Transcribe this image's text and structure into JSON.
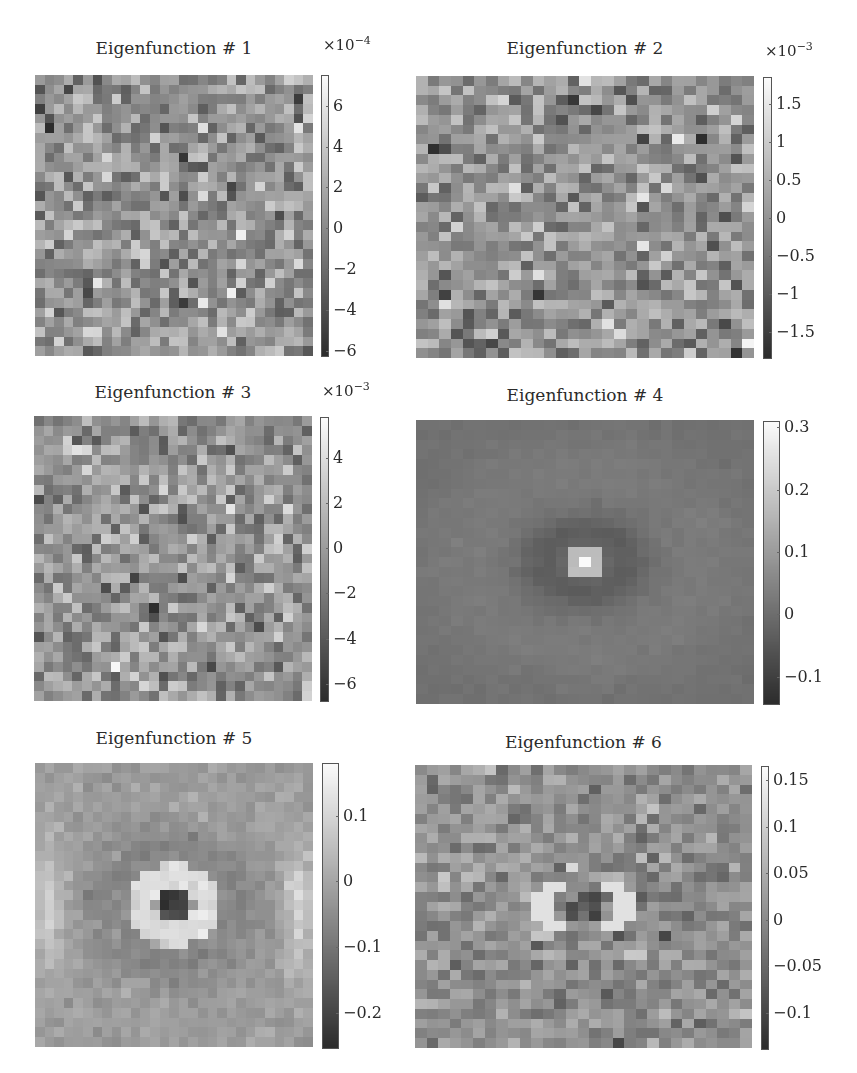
{
  "chart_data": [
    {
      "type": "heatmap",
      "title": "Eigenfunction # 1",
      "grid": [
        29,
        29
      ],
      "pattern": "noise",
      "colormap": "gray",
      "colorbar": {
        "multiplier": "×10",
        "exponent": "−4",
        "range": [
          -6.3,
          7.5
        ],
        "ticks": [
          6,
          4,
          2,
          0,
          -2,
          -4,
          -6
        ],
        "tick_labels": [
          "6",
          "4",
          "2",
          "0",
          "−2",
          "−4",
          "−6"
        ]
      },
      "layout": {
        "plot": [
          35,
          75,
          278,
          281
        ],
        "cbar": [
          321,
          75,
          8,
          282
        ],
        "title_y": 38,
        "mult_y": 34
      }
    },
    {
      "type": "heatmap",
      "title": "Eigenfunction # 2",
      "grid": [
        29,
        29
      ],
      "pattern": "noise",
      "colormap": "gray",
      "colorbar": {
        "multiplier": "×10",
        "exponent": "−3",
        "range": [
          -1.85,
          1.85
        ],
        "ticks": [
          1.5,
          1,
          0.5,
          0,
          -0.5,
          -1,
          -1.5
        ],
        "tick_labels": [
          "1.5",
          "1",
          "0.5",
          "0",
          "−0.5",
          "−1",
          "−1.5"
        ]
      },
      "layout": {
        "plot": [
          416,
          76,
          338,
          282
        ],
        "cbar": [
          763,
          77,
          9,
          282
        ],
        "title_y": 38,
        "mult_y": 40
      }
    },
    {
      "type": "heatmap",
      "title": "Eigenfunction # 3",
      "grid": [
        29,
        29
      ],
      "pattern": "noise",
      "colormap": "gray",
      "colorbar": {
        "multiplier": "×10",
        "exponent": "−3",
        "range": [
          -6.8,
          5.8
        ],
        "ticks": [
          4,
          2,
          0,
          -2,
          -4,
          -6
        ],
        "tick_labels": [
          "4",
          "2",
          "0",
          "−2",
          "−4",
          "−6"
        ]
      },
      "layout": {
        "plot": [
          34,
          416,
          278,
          285
        ],
        "cbar": [
          320,
          417,
          9,
          285
        ],
        "title_y": 382,
        "mult_y": 380
      }
    },
    {
      "type": "heatmap",
      "title": "Eigenfunction # 4",
      "grid": [
        29,
        29
      ],
      "pattern": "peak",
      "colormap": "gray",
      "colorbar": {
        "multiplier": "",
        "exponent": "",
        "range": [
          -0.145,
          0.31
        ],
        "ticks": [
          0.3,
          0.2,
          0.1,
          0,
          -0.1
        ],
        "tick_labels": [
          "0.3",
          "0.2",
          "0.1",
          "0",
          "−0.1"
        ]
      },
      "layout": {
        "plot": [
          416,
          420,
          338,
          284
        ],
        "cbar": [
          763,
          421,
          17,
          284
        ],
        "title_y": 385,
        "mult_y": 0
      }
    },
    {
      "type": "heatmap",
      "title": "Eigenfunction # 5",
      "grid": [
        29,
        29
      ],
      "pattern": "ring",
      "colormap": "gray",
      "colorbar": {
        "multiplier": "",
        "exponent": "",
        "range": [
          -0.255,
          0.18
        ],
        "ticks": [
          0.1,
          0,
          -0.1,
          -0.2
        ],
        "tick_labels": [
          "0.1",
          "0",
          "−0.1",
          "−0.2"
        ]
      },
      "layout": {
        "plot": [
          35,
          763,
          278,
          284
        ],
        "cbar": [
          322,
          763,
          17,
          286
        ],
        "title_y": 728,
        "mult_y": 0
      }
    },
    {
      "type": "heatmap",
      "title": "Eigenfunction # 6",
      "grid": [
        29,
        29
      ],
      "pattern": "ring_noisy",
      "colormap": "gray",
      "colorbar": {
        "multiplier": "",
        "exponent": "",
        "range": [
          -0.14,
          0.165
        ],
        "ticks": [
          0.15,
          0.1,
          0.05,
          0,
          -0.05,
          -0.1
        ],
        "tick_labels": [
          "0.15",
          "0.1",
          "0.05",
          "0",
          "−0.05",
          "−0.1"
        ]
      },
      "layout": {
        "plot": [
          415,
          765,
          337,
          283
        ],
        "cbar": [
          761,
          766,
          8,
          284
        ],
        "title_y": 732,
        "mult_y": 0
      }
    }
  ]
}
